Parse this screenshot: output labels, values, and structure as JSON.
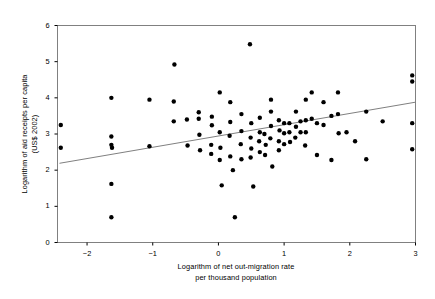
{
  "chart_data": {
    "type": "scatter",
    "title": "",
    "xlabel": "Logarithm of net out-migration rate\nper thousand population",
    "xlabel_line1": "Logarithm of net out-migration rate",
    "xlabel_line2": "per thousand population",
    "ylabel": "Logarithm of aid receipts per capita\n(US$ 2002)",
    "ylabel_line1": "Logarithm of aid receipts per capita",
    "ylabel_line2": "(US$ 2002)",
    "xlim": [
      -2.45,
      3.0
    ],
    "ylim": [
      0,
      6
    ],
    "xticks": [
      -2,
      -1,
      0,
      1,
      2,
      3
    ],
    "xtick_labels": [
      "−2",
      "−1",
      "0",
      "1",
      "2",
      "3"
    ],
    "yticks": [
      0,
      1,
      2,
      3,
      4,
      5,
      6
    ],
    "ytick_labels": [
      "0",
      "1",
      "2",
      "3",
      "4",
      "5",
      "6"
    ],
    "grid": false,
    "legend": false,
    "marker": "filled-circle",
    "marker_color": "#000000",
    "marker_size_px": 3.2,
    "frame_color": "#808080",
    "trendline": {
      "label": "linear fit",
      "color": "#808080",
      "x_start": -2.42,
      "y_start": 2.19,
      "x_end": 3.0,
      "y_end": 3.88
    },
    "points": [
      [
        -2.4,
        3.25
      ],
      [
        -2.4,
        2.62
      ],
      [
        -1.63,
        4.0
      ],
      [
        -1.63,
        2.93
      ],
      [
        -1.63,
        2.7
      ],
      [
        -1.62,
        2.62
      ],
      [
        -1.63,
        1.62
      ],
      [
        -1.63,
        0.7
      ],
      [
        -1.05,
        3.95
      ],
      [
        -1.05,
        2.66
      ],
      [
        -0.67,
        4.92
      ],
      [
        -0.68,
        3.35
      ],
      [
        -0.68,
        3.9
      ],
      [
        -0.48,
        3.4
      ],
      [
        -0.47,
        2.68
      ],
      [
        -0.3,
        3.6
      ],
      [
        -0.3,
        3.42
      ],
      [
        -0.29,
        2.98
      ],
      [
        -0.28,
        2.55
      ],
      [
        -0.1,
        3.48
      ],
      [
        -0.1,
        3.24
      ],
      [
        -0.11,
        2.7
      ],
      [
        -0.11,
        2.45
      ],
      [
        0.02,
        4.15
      ],
      [
        0.02,
        3.05
      ],
      [
        0.03,
        2.62
      ],
      [
        0.02,
        2.28
      ],
      [
        0.05,
        1.58
      ],
      [
        0.18,
        3.88
      ],
      [
        0.18,
        3.33
      ],
      [
        0.17,
        2.95
      ],
      [
        0.18,
        2.38
      ],
      [
        0.22,
        2.0
      ],
      [
        0.25,
        0.7
      ],
      [
        0.35,
        3.55
      ],
      [
        0.35,
        3.08
      ],
      [
        0.34,
        2.72
      ],
      [
        0.35,
        2.3
      ],
      [
        0.48,
        5.48
      ],
      [
        0.5,
        3.3
      ],
      [
        0.49,
        2.9
      ],
      [
        0.5,
        2.6
      ],
      [
        0.49,
        2.35
      ],
      [
        0.53,
        1.55
      ],
      [
        0.63,
        3.45
      ],
      [
        0.63,
        3.05
      ],
      [
        0.62,
        2.8
      ],
      [
        0.63,
        2.5
      ],
      [
        0.7,
        3.0
      ],
      [
        0.72,
        2.7
      ],
      [
        0.71,
        2.42
      ],
      [
        0.8,
        3.95
      ],
      [
        0.8,
        3.62
      ],
      [
        0.8,
        3.22
      ],
      [
        0.79,
        2.88
      ],
      [
        0.82,
        2.1
      ],
      [
        0.92,
        3.38
      ],
      [
        0.93,
        3.1
      ],
      [
        0.92,
        2.8
      ],
      [
        0.92,
        2.55
      ],
      [
        1.0,
        3.3
      ],
      [
        1.0,
        3.02
      ],
      [
        1.0,
        2.72
      ],
      [
        1.08,
        3.3
      ],
      [
        1.08,
        3.05
      ],
      [
        1.09,
        2.78
      ],
      [
        1.18,
        3.62
      ],
      [
        1.18,
        3.2
      ],
      [
        1.17,
        2.9
      ],
      [
        1.25,
        3.35
      ],
      [
        1.25,
        3.05
      ],
      [
        1.33,
        3.95
      ],
      [
        1.33,
        3.38
      ],
      [
        1.33,
        3.05
      ],
      [
        1.32,
        2.68
      ],
      [
        1.42,
        4.15
      ],
      [
        1.42,
        3.42
      ],
      [
        1.5,
        3.3
      ],
      [
        1.5,
        2.42
      ],
      [
        1.6,
        3.88
      ],
      [
        1.6,
        3.25
      ],
      [
        1.72,
        3.5
      ],
      [
        1.72,
        2.28
      ],
      [
        1.82,
        4.15
      ],
      [
        1.82,
        3.55
      ],
      [
        1.83,
        3.02
      ],
      [
        1.95,
        3.05
      ],
      [
        2.08,
        2.8
      ],
      [
        2.25,
        3.62
      ],
      [
        2.25,
        2.3
      ],
      [
        2.5,
        3.35
      ],
      [
        2.95,
        4.62
      ],
      [
        2.95,
        4.45
      ],
      [
        2.95,
        3.3
      ],
      [
        2.95,
        2.58
      ]
    ]
  }
}
